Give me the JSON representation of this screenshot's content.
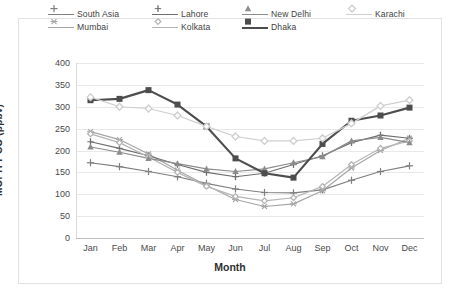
{
  "chart_data": {
    "type": "line",
    "title": "",
    "xlabel": "Month",
    "ylabel": "MOPITT CO (ppbv)",
    "categories": [
      "Jan",
      "Feb",
      "Mar",
      "Apr",
      "May",
      "Jun",
      "Jul",
      "Aug",
      "Sep",
      "Oct",
      "Nov",
      "Dec"
    ],
    "ylim": [
      0,
      400
    ],
    "ytick_labels": [
      "400",
      "350",
      "300",
      "250",
      "200",
      "150",
      "100",
      "50",
      "0"
    ],
    "ytick_values": [
      400,
      350,
      300,
      250,
      200,
      150,
      100,
      50,
      0
    ],
    "grid": true,
    "legend_position": "top",
    "series": [
      {
        "name": "South Asia",
        "color": "#7f7f7f",
        "marker": "plus",
        "values": [
          172,
          163,
          152,
          140,
          125,
          112,
          104,
          103,
          110,
          132,
          152,
          165
        ]
      },
      {
        "name": "Mumbai",
        "color": "#a6a6a6",
        "marker": "star",
        "values": [
          243,
          225,
          192,
          155,
          120,
          88,
          72,
          78,
          108,
          160,
          200,
          228
        ]
      },
      {
        "name": "Lahore",
        "color": "#6e6e6e",
        "marker": "dash",
        "values": [
          220,
          205,
          188,
          168,
          150,
          140,
          148,
          168,
          188,
          218,
          235,
          228
        ]
      },
      {
        "name": "Kolkata",
        "color": "#b5b5b5",
        "marker": "diamond-small",
        "values": [
          238,
          218,
          185,
          150,
          118,
          95,
          85,
          92,
          118,
          168,
          205,
          222
        ]
      },
      {
        "name": "New Delhi",
        "color": "#8c8c8c",
        "marker": "triangle",
        "values": [
          208,
          196,
          182,
          170,
          158,
          152,
          158,
          172,
          186,
          222,
          230,
          218
        ]
      },
      {
        "name": "Dhaka",
        "color": "#4d4d4d",
        "marker": "square",
        "values": [
          315,
          318,
          338,
          305,
          255,
          182,
          148,
          138,
          215,
          268,
          280,
          298
        ]
      },
      {
        "name": "Karachi",
        "color": "#cfcfcf",
        "marker": "diamond",
        "values": [
          322,
          300,
          296,
          280,
          255,
          232,
          222,
          222,
          228,
          262,
          302,
          315
        ]
      }
    ]
  },
  "legend": {
    "entries": [
      {
        "label": "South Asia"
      },
      {
        "label": "Lahore"
      },
      {
        "label": "New Delhi"
      },
      {
        "label": "Karachi"
      },
      {
        "label": "Mumbai"
      },
      {
        "label": "Kolkata"
      },
      {
        "label": "Dhaka"
      }
    ],
    "order": [
      0,
      2,
      4,
      6,
      1,
      3,
      5
    ]
  }
}
